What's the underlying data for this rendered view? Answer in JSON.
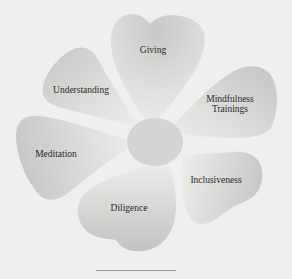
{
  "diagram": {
    "title": "",
    "center": {
      "label": "",
      "color": "#d4d4d2"
    },
    "petals": [
      {
        "id": "giving",
        "label": "Giving"
      },
      {
        "id": "mindfulness-trainings",
        "label_line1": "Mindfulness",
        "label_line2": "Trainings"
      },
      {
        "id": "inclusiveness",
        "label": "Inclusiveness"
      },
      {
        "id": "diligence",
        "label": "Diligence"
      },
      {
        "id": "meditation",
        "label": "Meditation"
      },
      {
        "id": "understanding",
        "label": "Understanding"
      }
    ],
    "colors": {
      "background": "#efefed",
      "petal_light": "#ececea",
      "petal_dark": "#c4c4c2",
      "text": "#2a2a2a",
      "rule": "#9a9a9a"
    }
  }
}
